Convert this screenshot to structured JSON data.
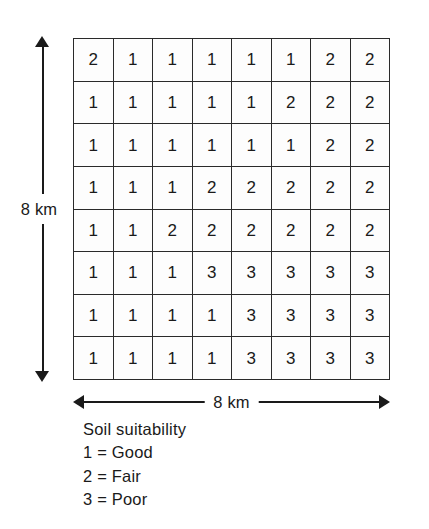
{
  "figure": {
    "vertical_axis": {
      "label": "8 km",
      "arrow": "double-headed-vertical-arrow"
    },
    "horizontal_axis": {
      "label": "8 km",
      "arrow": "double-headed-horizontal-arrow"
    }
  },
  "legend": {
    "title": "Soil suitability",
    "entries": [
      {
        "text": "1 = Good"
      },
      {
        "text": "2 = Fair"
      },
      {
        "text": "3 = Poor"
      }
    ]
  },
  "chart_data": {
    "type": "heatmap",
    "title": "Soil suitability",
    "xlabel": "8 km",
    "ylabel": "8 km",
    "rows": 8,
    "cols": 8,
    "cell_size_km": 1,
    "value_labels": {
      "1": "Good",
      "2": "Fair",
      "3": "Poor"
    },
    "grid": [
      [
        2,
        1,
        1,
        1,
        1,
        1,
        2,
        2
      ],
      [
        1,
        1,
        1,
        1,
        1,
        2,
        2,
        2
      ],
      [
        1,
        1,
        1,
        1,
        1,
        1,
        2,
        2
      ],
      [
        1,
        1,
        1,
        2,
        2,
        2,
        2,
        2
      ],
      [
        1,
        1,
        2,
        2,
        2,
        2,
        2,
        2
      ],
      [
        1,
        1,
        1,
        3,
        3,
        3,
        3,
        3
      ],
      [
        1,
        1,
        1,
        1,
        3,
        3,
        3,
        3
      ],
      [
        1,
        1,
        1,
        1,
        3,
        3,
        3,
        3
      ]
    ]
  }
}
